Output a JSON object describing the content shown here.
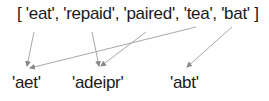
{
  "input_list": {
    "open_bracket": "[",
    "items": [
      "'eat'",
      "'repaid'",
      "'paired'",
      "'tea'",
      "'bat'"
    ],
    "close_bracket": "]",
    "display": "[ 'eat', 'repaid', 'paired', 'tea', 'bat' ]"
  },
  "groups": [
    {
      "key": "'aet'",
      "members": [
        "'eat'",
        "'tea'"
      ]
    },
    {
      "key": "'adeipr'",
      "members": [
        "'repaid'",
        "'paired'"
      ]
    },
    {
      "key": "'abt'",
      "members": [
        "'bat'"
      ]
    }
  ],
  "colors": {
    "text": "#1a1a1a",
    "arrow": "#a8a8a8"
  }
}
